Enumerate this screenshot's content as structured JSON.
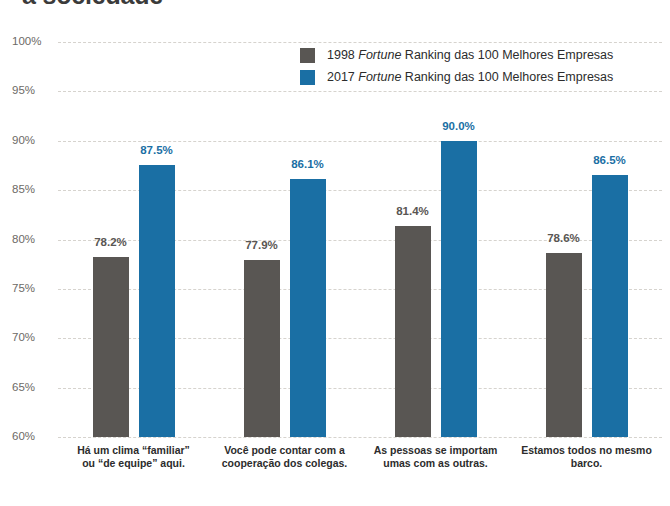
{
  "title": "a sociedade",
  "legend": {
    "position": "top-right",
    "items": [
      {
        "series_key": "s1998",
        "year": "1998",
        "emphasis": "Fortune",
        "rest": "Ranking das 100 Melhores Empresas",
        "color": "#595653"
      },
      {
        "series_key": "s2017",
        "year": "2017",
        "emphasis": "Fortune",
        "rest": "Ranking das 100 Melhores Empresas",
        "color": "#1a6fa4"
      }
    ]
  },
  "axis": {
    "ticks": [
      "100%",
      "95%",
      "90%",
      "85%",
      "80%",
      "75%",
      "70%",
      "65%",
      "60%"
    ]
  },
  "chart_data": {
    "type": "bar",
    "title": "a sociedade",
    "xlabel": "",
    "ylabel": "",
    "ylim": [
      60,
      100
    ],
    "ytick_step": 5,
    "ytick_labels": [
      "60%",
      "65%",
      "70%",
      "75%",
      "80%",
      "85%",
      "90%",
      "95%",
      "100%"
    ],
    "grid": true,
    "legend_position": "top-right",
    "categories": [
      "Há um clima “familiar” ou “de equipe” aqui.",
      "Você pode contar com a cooperação dos colegas.",
      "As pessoas se importam umas com as outras.",
      "Estamos todos no mesmo barco."
    ],
    "category_lines": [
      [
        "Há um clima “familiar”",
        "ou “de equipe” aqui."
      ],
      [
        "Você pode contar com a",
        "cooperação dos colegas."
      ],
      [
        "As pessoas se importam",
        "umas com as outras."
      ],
      [
        "Estamos todos no mesmo",
        "barco."
      ]
    ],
    "series": [
      {
        "name": "1998 Fortune Ranking das 100 Melhores Empresas",
        "key": "s1998",
        "color": "#595653",
        "values": [
          78.2,
          77.9,
          81.4,
          78.6
        ],
        "labels": [
          "78.2%",
          "77.9%",
          "81.4%",
          "78.6%"
        ]
      },
      {
        "name": "2017 Fortune Ranking das 100 Melhores Empresas",
        "key": "s2017",
        "color": "#1a6fa4",
        "values": [
          87.5,
          86.1,
          90.0,
          86.5
        ],
        "labels": [
          "87.5%",
          "86.1%",
          "90.0%",
          "86.5%"
        ]
      }
    ]
  }
}
